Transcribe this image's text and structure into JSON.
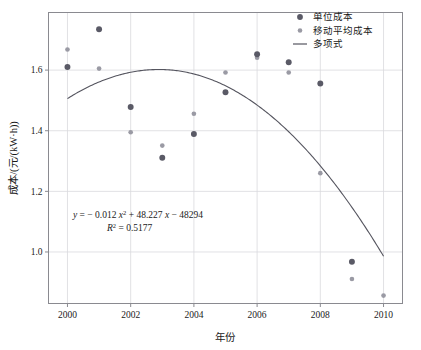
{
  "chart_data": {
    "type": "scatter",
    "title": "",
    "xlabel": "年份",
    "ylabel": "成本/(元/(kW·h))",
    "xlim": [
      1999.4,
      2010.6
    ],
    "ylim": [
      0.83,
      1.79
    ],
    "xticks": [
      "2000",
      "2002",
      "2004",
      "2006",
      "2008",
      "2010"
    ],
    "xtick_values": [
      2000,
      2002,
      2004,
      2006,
      2008,
      2010
    ],
    "yticks": [
      "1.0",
      "1.2",
      "1.4",
      "1.6"
    ],
    "ytick_values": [
      1.0,
      1.2,
      1.4,
      1.6
    ],
    "grid": true,
    "legend_position": "top-right",
    "x": [
      2000,
      2001,
      2002,
      2003,
      2004,
      2005,
      2006,
      2007,
      2008,
      2009,
      2010
    ],
    "series": [
      {
        "name": "单位成本",
        "marker": "circle-filled",
        "color": "#5a5a66",
        "size": 4.6,
        "x": [
          2000,
          2001,
          2002,
          2003,
          2004,
          2005,
          2006,
          2007,
          2008,
          2009
        ],
        "values": [
          1.61,
          1.735,
          1.478,
          1.311,
          1.389,
          1.527,
          1.652,
          1.626,
          1.556,
          0.968
        ]
      },
      {
        "name": "移动平均成本",
        "marker": "circle-filled",
        "color": "#9a9aa4",
        "size": 3.6,
        "x": [
          2000,
          2001,
          2002,
          2003,
          2004,
          2005,
          2006,
          2007,
          2008,
          2009,
          2010
        ],
        "values": [
          1.668,
          1.605,
          1.395,
          1.351,
          1.456,
          1.592,
          1.641,
          1.592,
          1.26,
          0.911,
          0.856
        ]
      }
    ],
    "fit": {
      "name": "多项式",
      "type": "polynomial",
      "degree": 2,
      "color": "#55555f",
      "coefficients": {
        "a": -0.012,
        "b": 48.227,
        "c": -48294
      },
      "r_squared": 0.5177,
      "x_start": 2000,
      "x_end": 2010,
      "y_start": 1.506,
      "y_peak": 1.602,
      "x_peak": 2009.46,
      "y_end": 0.986
    },
    "annotation": {
      "equation_prefix": "y",
      "equation_eq": " = − 0.012 ",
      "equation_x1": "x",
      "equation_sup1": "2",
      "equation_mid": " + 48.227 ",
      "equation_x2": "x",
      "equation_tail": " − 48294",
      "r2_symbol": "R",
      "r2_sup": "2",
      "r2_value": " = 0.5177",
      "full_equation": "y = − 0.012 x² + 48.227 x − 48294",
      "full_r2": "R² = 0.5177"
    },
    "legend": [
      {
        "label": "单位成本",
        "type": "marker",
        "color": "#5a5a66"
      },
      {
        "label": "移动平均成本",
        "type": "marker",
        "color": "#9a9aa4"
      },
      {
        "label": "多项式",
        "type": "line",
        "color": "#55555f"
      }
    ],
    "colors": {
      "unit_cost": "#5a5a66",
      "moving_average": "#9a9aa4",
      "fit_line": "#55555f",
      "grid": "#d9d9dd",
      "frame": "#8a8a90",
      "background": "#ffffff"
    }
  }
}
